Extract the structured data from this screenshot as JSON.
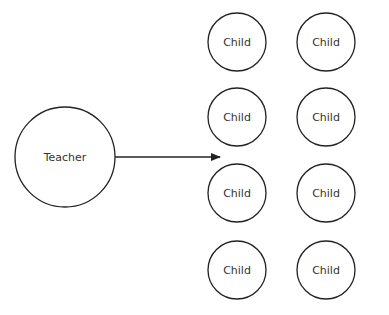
{
  "diagram": {
    "teacher": {
      "label": "Teacher",
      "cx": 65,
      "cy": 157,
      "r": 50
    },
    "arrow": {
      "x1": 115,
      "y1": 157,
      "x2": 220,
      "y2": 157
    },
    "children": [
      {
        "label": "Child",
        "cx": 237,
        "cy": 42,
        "r": 29
      },
      {
        "label": "Child",
        "cx": 326,
        "cy": 42,
        "r": 29
      },
      {
        "label": "Child",
        "cx": 237,
        "cy": 117,
        "r": 29
      },
      {
        "label": "Child",
        "cx": 326,
        "cy": 117,
        "r": 29
      },
      {
        "label": "Child",
        "cx": 237,
        "cy": 193,
        "r": 29
      },
      {
        "label": "Child",
        "cx": 326,
        "cy": 193,
        "r": 29
      },
      {
        "label": "Child",
        "cx": 237,
        "cy": 270,
        "r": 29
      },
      {
        "label": "Child",
        "cx": 326,
        "cy": 270,
        "r": 29
      }
    ],
    "colors": {
      "stroke": "#222222",
      "text": "#333333",
      "background": "#ffffff"
    }
  }
}
